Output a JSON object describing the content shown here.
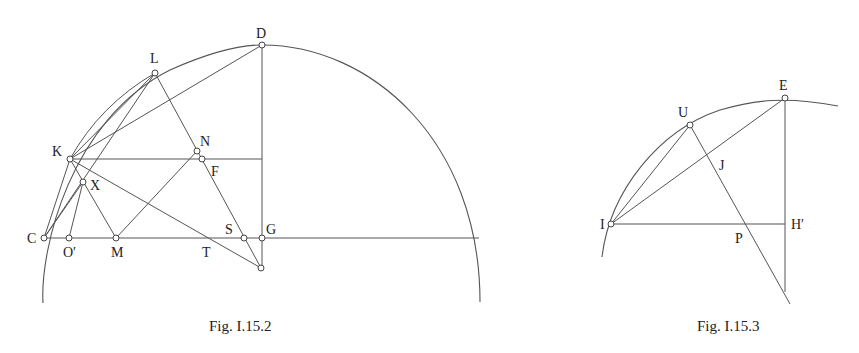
{
  "figures": [
    {
      "caption": "Fig. I.15.2",
      "labels": {
        "D": "D",
        "L": "L",
        "K": "K",
        "N": "N",
        "F": "F",
        "X": "X",
        "C": "C",
        "O": "O′",
        "M": "M",
        "T": "T",
        "S": "S",
        "G": "G"
      }
    },
    {
      "caption": "Fig. I.15.3",
      "labels": {
        "E": "E",
        "U": "U",
        "J": "J",
        "I": "I",
        "P": "P",
        "H": "H′"
      }
    }
  ]
}
